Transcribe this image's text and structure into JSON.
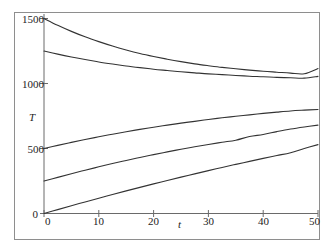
{
  "figure": {
    "background_color": "#ffffff",
    "frame_color": "#8e8e8e",
    "curve_color": "#333333",
    "axis_color": "#555555"
  },
  "chart_data": {
    "type": "line",
    "title": "",
    "subtitle": "",
    "xlabel": "t",
    "ylabel": "T",
    "xlim": [
      0,
      50
    ],
    "ylim": [
      0,
      1560
    ],
    "grid": false,
    "legend": "none",
    "x_ticks": [
      0,
      10,
      20,
      30,
      40,
      50
    ],
    "x_tick_labels": [
      "0",
      "10",
      "20",
      "30",
      "40",
      "50"
    ],
    "y_ticks": [
      0,
      500,
      1000,
      1500
    ],
    "y_tick_labels": [
      "0",
      "500",
      "1000",
      "1500"
    ],
    "origin_label": "0",
    "x": [
      0,
      2.5,
      5,
      7.5,
      10,
      12.5,
      15,
      17.5,
      20,
      22.5,
      25,
      27.5,
      30,
      32.5,
      35,
      37.5,
      40,
      42.5,
      45,
      47.5,
      50
    ],
    "series": [
      {
        "name": "T0 = 1500",
        "initial_value": 1500,
        "final_value": 1115,
        "shape": "decaying-exponential",
        "values": [
          1500,
          1448,
          1401,
          1359,
          1322,
          1288,
          1258,
          1231,
          1208,
          1187,
          1168,
          1151,
          1137,
          1124,
          1113,
          1103,
          1094,
          1087,
          1080,
          1075,
          1115
        ]
      },
      {
        "name": "T0 = 1250",
        "initial_value": 1250,
        "final_value": 1055,
        "shape": "decaying-exponential",
        "values": [
          1250,
          1226,
          1204,
          1184,
          1166,
          1150,
          1135,
          1122,
          1110,
          1100,
          1090,
          1082,
          1074,
          1068,
          1062,
          1056,
          1052,
          1047,
          1044,
          1041,
          1055
        ]
      },
      {
        "name": "T0 = 500",
        "initial_value": 500,
        "final_value": 800,
        "shape": "rising-saturating",
        "values": [
          500,
          524,
          547,
          569,
          590,
          610,
          629,
          647,
          664,
          680,
          695,
          709,
          723,
          736,
          748,
          759,
          770,
          780,
          789,
          795,
          800
        ]
      },
      {
        "name": "T0 = 250",
        "initial_value": 250,
        "final_value": 680,
        "shape": "rising-saturating",
        "values": [
          250,
          278,
          306,
          333,
          359,
          384,
          408,
          431,
          453,
          474,
          494,
          513,
          531,
          548,
          564,
          592,
          608,
          630,
          650,
          666,
          680
        ]
      },
      {
        "name": "T0 = 0",
        "initial_value": 0,
        "final_value": 530,
        "shape": "rising-near-linear",
        "values": [
          0,
          30,
          60,
          89,
          118,
          146,
          174,
          201,
          228,
          254,
          280,
          305,
          330,
          354,
          378,
          401,
          424,
          446,
          468,
          500,
          530
        ]
      }
    ]
  }
}
